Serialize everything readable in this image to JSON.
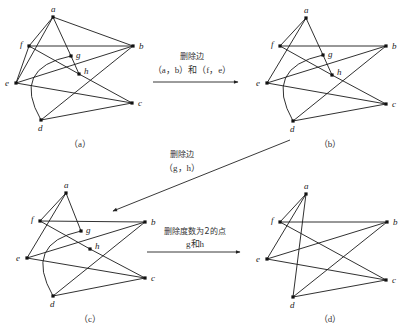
{
  "figure": {
    "panels": [
      {
        "id": "a",
        "caption": "（a）",
        "nodes": {
          "a": [
            53,
            17
          ],
          "f": [
            29,
            46
          ],
          "b": [
            133,
            46
          ],
          "g": [
            71,
            56
          ],
          "h": [
            79,
            74
          ],
          "e": [
            16,
            83
          ],
          "c": [
            132,
            103
          ],
          "d": [
            41,
            120
          ]
        },
        "edges": [
          [
            "a",
            "f"
          ],
          [
            "a",
            "e"
          ],
          [
            "a",
            "b"
          ],
          [
            "a",
            "g"
          ],
          [
            "g",
            "h"
          ],
          [
            "f",
            "e"
          ],
          [
            "f",
            "b"
          ],
          [
            "f",
            "h"
          ],
          [
            "h",
            "c"
          ],
          [
            "e",
            "b"
          ],
          [
            "e",
            "c"
          ],
          [
            "d",
            "c"
          ],
          [
            "d",
            "b"
          ]
        ],
        "arcs": [
          [
            "d",
            "g"
          ]
        ],
        "caption_pos": [
          80,
          147
        ]
      },
      {
        "id": "b",
        "caption": "（b）",
        "nodes": {
          "a": [
            306,
            18
          ],
          "f": [
            280,
            46
          ],
          "b": [
            386,
            46
          ],
          "g": [
            323,
            55
          ],
          "h": [
            332,
            75
          ],
          "e": [
            267,
            83
          ],
          "c": [
            386,
            104
          ],
          "d": [
            293,
            121
          ]
        },
        "edges": [
          [
            "a",
            "f"
          ],
          [
            "a",
            "e"
          ],
          [
            "a",
            "g"
          ],
          [
            "g",
            "h"
          ],
          [
            "f",
            "b"
          ],
          [
            "f",
            "h"
          ],
          [
            "h",
            "c"
          ],
          [
            "e",
            "b"
          ],
          [
            "e",
            "c"
          ],
          [
            "d",
            "c"
          ],
          [
            "d",
            "b"
          ]
        ],
        "arcs": [
          [
            "d",
            "g"
          ]
        ],
        "caption_pos": [
          330,
          147
        ]
      },
      {
        "id": "c",
        "caption": "（c）",
        "nodes": {
          "a": [
            66,
            193
          ],
          "f": [
            40,
            221
          ],
          "b": [
            145,
            222
          ],
          "g": [
            81,
            231
          ],
          "h": [
            90,
            249
          ],
          "e": [
            27,
            258
          ],
          "c": [
            145,
            278
          ],
          "d": [
            53,
            296
          ]
        },
        "edges": [
          [
            "a",
            "f"
          ],
          [
            "a",
            "e"
          ],
          [
            "a",
            "g"
          ],
          [
            "f",
            "b"
          ],
          [
            "f",
            "h"
          ],
          [
            "h",
            "c"
          ],
          [
            "e",
            "b"
          ],
          [
            "e",
            "c"
          ],
          [
            "d",
            "c"
          ],
          [
            "d",
            "b"
          ]
        ],
        "arcs": [
          [
            "d",
            "g"
          ]
        ],
        "caption_pos": [
          90,
          322
        ]
      },
      {
        "id": "d",
        "caption": "（d）",
        "nodes": {
          "a": [
            306,
            194
          ],
          "f": [
            280,
            222
          ],
          "b": [
            387,
            222
          ],
          "e": [
            267,
            259
          ],
          "c": [
            386,
            280
          ],
          "d": [
            293,
            297
          ]
        },
        "edges": [
          [
            "a",
            "f"
          ],
          [
            "a",
            "e"
          ],
          [
            "a",
            "d"
          ],
          [
            "f",
            "b"
          ],
          [
            "f",
            "c"
          ],
          [
            "e",
            "b"
          ],
          [
            "e",
            "c"
          ],
          [
            "d",
            "c"
          ],
          [
            "d",
            "b"
          ]
        ],
        "arcs": [],
        "caption_pos": [
          330,
          322
        ]
      }
    ],
    "steps": [
      {
        "line1": "删除边",
        "line2": "（a，b）和（f，e）"
      },
      {
        "line1": "删除边",
        "line2": "（g，h）"
      },
      {
        "line1": "删除度数为2的点",
        "line2": "g和h"
      }
    ]
  }
}
